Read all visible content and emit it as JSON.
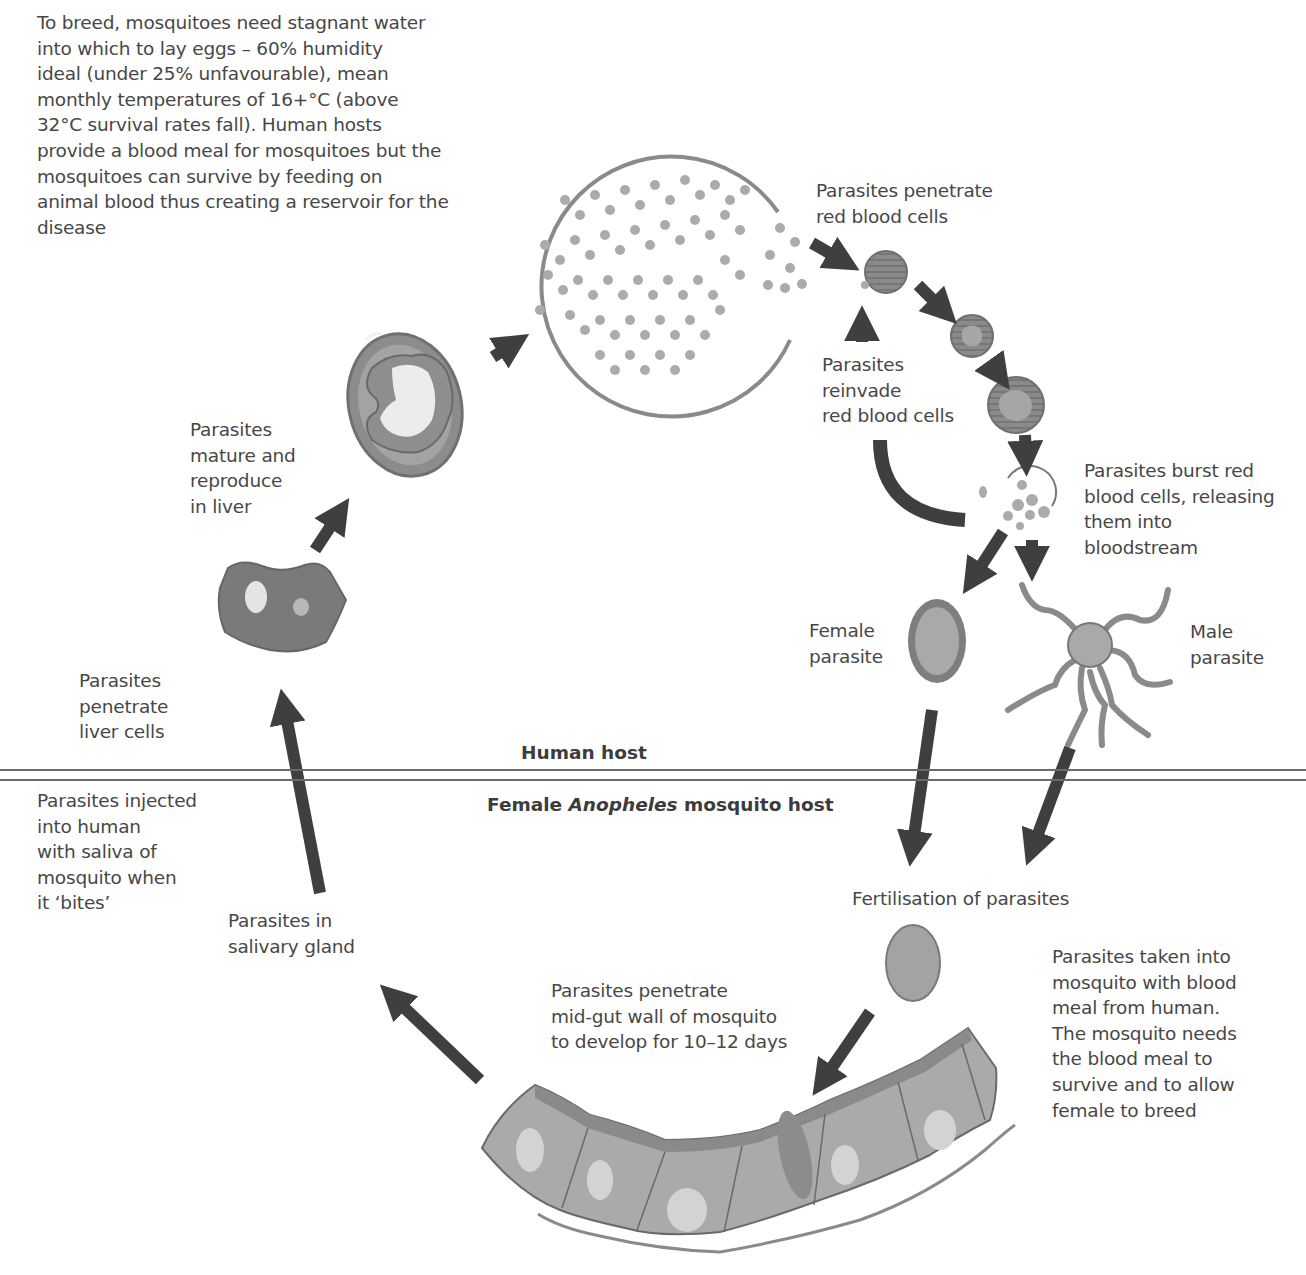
{
  "diagram": {
    "colors": {
      "arrow": "#3f3f3f",
      "cell_fill": "#a9a9a9",
      "cell_dark": "#7f7f7f",
      "light": "#dcdcdc",
      "parasite": "#9b9b9b",
      "text": "#474747"
    },
    "intro_note": "To breed, mosquitoes need stagnant water\ninto which to lay eggs – 60% humidity\nideal (under 25% unfavourable), mean\nmonthly temperatures of 16+°C (above\n32°C survival rates fall). Human hosts\nprovide a blood meal for mosquitoes but the\nmosquitoes can survive by feeding on\nanimal blood thus creating a reservoir for the\ndisease",
    "sections": {
      "human_host": "Human host",
      "mosquito_host_prefix": "Female ",
      "mosquito_host_genus": "Anopheles",
      "mosquito_host_suffix": " mosquito host"
    },
    "stages": {
      "penetrate_red": "Parasites penetrate\nred blood cells",
      "reinvade": "Parasites\nreinvade\nred blood cells",
      "burst": "Parasites burst red\nblood cells, releasing\nthem into\nbloodstream",
      "mature_liver": "Parasites\nmature and\nreproduce\nin liver",
      "female_parasite": "Female\nparasite",
      "male_parasite": "Male\nparasite",
      "penetrate_liver": "Parasites\npenetrate\nliver cells",
      "injected": "Parasites injected\ninto human\nwith saliva of\nmosquito when\nit ‘bites’",
      "fertilisation": "Fertilisation of parasites",
      "salivary": "Parasites in\nsalivary gland",
      "midgut": "Parasites penetrate\nmid-gut wall of mosquito\nto develop for 10–12 days",
      "blood_meal": "Parasites taken into\nmosquito with blood\nmeal from human.\nThe mosquito needs\nthe blood meal to\nsurvive and to allow\nfemale to breed"
    }
  }
}
